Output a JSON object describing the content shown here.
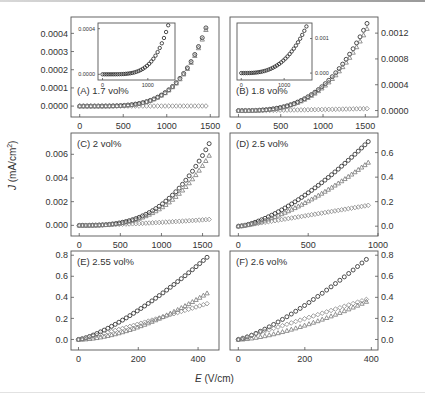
{
  "figure": {
    "ylabel_var": "J",
    "ylabel_unit": " (mA/cm",
    "ylabel_exp": "2",
    "ylabel_close": ")",
    "xlabel_var": "E",
    "xlabel_unit": " (V/cm)"
  },
  "chart_data": [
    {
      "type": "scatter",
      "panel": "A",
      "title": "(A) 1.7 vol%",
      "box": [
        71,
        17,
        219,
        117
      ],
      "yaxis_side": "left",
      "xlim": [
        -100,
        1600
      ],
      "ylim": [
        -6e-05,
        0.00049
      ],
      "xticks": [
        0,
        500,
        1000,
        1500
      ],
      "xtick_labels": [
        "0",
        "500",
        "1000",
        "1500"
      ],
      "yticks": [
        0,
        0.0001,
        0.0002,
        0.0003,
        0.0004
      ],
      "ytick_labels": [
        "0.0000",
        "0.0001",
        "0.0002",
        "0.0003",
        "0.0004"
      ],
      "label_pos": [
        77,
        94
      ],
      "series": [
        {
          "name": "circle",
          "marker": "circle",
          "color": "#222222",
          "x_max": 1450,
          "n": 35,
          "y_end": 0.00043,
          "power": 4.5
        },
        {
          "name": "triangle",
          "marker": "triangle",
          "color": "#777777",
          "x_max": 1450,
          "n": 35,
          "y_end": 0.00042,
          "power": 4.5
        },
        {
          "name": "diamond",
          "marker": "diamond",
          "color": "#888888",
          "x_max": 1450,
          "n": 35,
          "y_end": 5e-07,
          "power": 1
        }
      ],
      "inset": {
        "box": [
          98,
          23,
          175,
          80
        ],
        "xlim": [
          -100,
          1600
        ],
        "ylim": [
          -5e-05,
          0.00045
        ],
        "xticks": [
          0,
          1000
        ],
        "xtick_labels": [
          "0",
          "1000"
        ],
        "yticks": [
          0,
          0.0004
        ],
        "ytick_labels": [
          "0.0000",
          "0.0004"
        ],
        "yaxis_side": "left",
        "series": [
          {
            "marker": "circle",
            "color": "#222222",
            "x_max": 1450,
            "n": 32,
            "y_end": 0.00043,
            "power": 4.5
          }
        ]
      }
    },
    {
      "type": "scatter",
      "panel": "B",
      "title": "(B) 1.8 vol%",
      "box": [
        230,
        17,
        378,
        117
      ],
      "yaxis_side": "right",
      "xlim": [
        -100,
        1650
      ],
      "ylim": [
        -0.0001,
        0.00145
      ],
      "xticks": [
        0,
        500,
        1000,
        1500
      ],
      "xtick_labels": [
        "0",
        "500",
        "1000",
        "1500"
      ],
      "yticks": [
        0,
        0.0004,
        0.0008,
        0.0012
      ],
      "ytick_labels": [
        "0.0000",
        "0.0004",
        "0.0008",
        "0.0012"
      ],
      "label_pos": [
        236,
        94
      ],
      "series": [
        {
          "name": "circle",
          "marker": "circle",
          "color": "#222222",
          "x_max": 1520,
          "n": 38,
          "y_end": 0.00135,
          "power": 3.0
        },
        {
          "name": "triangle",
          "marker": "triangle",
          "color": "#777777",
          "x_max": 1520,
          "n": 38,
          "y_end": 0.00127,
          "power": 3.0
        },
        {
          "name": "diamond",
          "marker": "diamond",
          "color": "#888888",
          "x_max": 1520,
          "n": 38,
          "y_end": 3e-05,
          "power": 1.5
        }
      ],
      "inset": {
        "box": [
          237,
          23,
          312,
          80
        ],
        "xlim": [
          -100,
          1650
        ],
        "ylim": [
          -0.0002,
          0.00145
        ],
        "xticks": [
          0,
          1000
        ],
        "xtick_labels": [
          "0",
          "1000"
        ],
        "yticks": [
          0,
          0.001
        ],
        "ytick_labels": [
          "0.000",
          "0.001"
        ],
        "yaxis_side": "right",
        "series": [
          {
            "marker": "circle",
            "color": "#222222",
            "x_max": 1520,
            "n": 32,
            "y_end": 0.00135,
            "power": 3.0
          }
        ]
      }
    },
    {
      "type": "scatter",
      "panel": "C",
      "title": "(C) 2 vol%",
      "box": [
        71,
        133,
        219,
        236
      ],
      "yaxis_side": "left",
      "xlim": [
        -100,
        1700
      ],
      "ylim": [
        -0.0009,
        0.0078
      ],
      "xticks": [
        0,
        500,
        1000,
        1500
      ],
      "xtick_labels": [
        "0",
        "500",
        "1000",
        "1500"
      ],
      "yticks": [
        0,
        0.002,
        0.004,
        0.006
      ],
      "ytick_labels": [
        "0.000",
        "0.002",
        "0.004",
        "0.006"
      ],
      "label_pos": [
        77,
        147
      ],
      "series": [
        {
          "name": "circle",
          "marker": "circle",
          "color": "#222222",
          "x_max": 1580,
          "n": 40,
          "y_end": 0.0069,
          "power": 3.0
        },
        {
          "name": "triangle",
          "marker": "triangle",
          "color": "#777777",
          "x_max": 1580,
          "n": 40,
          "y_end": 0.0059,
          "power": 3.0
        },
        {
          "name": "diamond",
          "marker": "diamond",
          "color": "#888888",
          "x_max": 1580,
          "n": 40,
          "y_end": 0.0005,
          "power": 1.5
        }
      ]
    },
    {
      "type": "scatter",
      "panel": "D",
      "title": "(D) 2.5 vol%",
      "box": [
        230,
        133,
        378,
        236
      ],
      "yaxis_side": "right",
      "xlim": [
        -60,
        1000
      ],
      "ylim": [
        -0.08,
        0.76
      ],
      "xticks": [
        0,
        500,
        1000
      ],
      "xtick_labels": [
        "0",
        "500",
        "1000"
      ],
      "yticks": [
        0,
        0.2,
        0.4,
        0.6
      ],
      "ytick_labels": [
        "0.0",
        "0.2",
        "0.4",
        "0.6"
      ],
      "label_pos": [
        236,
        147
      ],
      "series": [
        {
          "name": "circle",
          "marker": "circle",
          "color": "#222222",
          "x_max": 930,
          "n": 40,
          "y_end": 0.69,
          "power": 1.5
        },
        {
          "name": "triangle",
          "marker": "triangle",
          "color": "#777777",
          "x_max": 930,
          "n": 40,
          "y_end": 0.52,
          "power": 1.5
        },
        {
          "name": "diamond",
          "marker": "diamond",
          "color": "#888888",
          "x_max": 930,
          "n": 40,
          "y_end": 0.17,
          "power": 1.05
        }
      ]
    },
    {
      "type": "scatter",
      "panel": "E",
      "title": "(E) 2.55 vol%",
      "box": [
        71,
        251,
        219,
        350
      ],
      "yaxis_side": "left",
      "xlim": [
        -25,
        470
      ],
      "ylim": [
        -0.1,
        0.84
      ],
      "xticks": [
        0,
        200,
        400
      ],
      "xtick_labels": [
        "0",
        "200",
        "400"
      ],
      "yticks": [
        0,
        0.2,
        0.4,
        0.6,
        0.8
      ],
      "ytick_labels": [
        "0.0",
        "0.2",
        "0.4",
        "0.6",
        "0.8"
      ],
      "label_pos": [
        77,
        265
      ],
      "series": [
        {
          "name": "circle",
          "marker": "circle",
          "color": "#222222",
          "x_max": 430,
          "n": 36,
          "y_end": 0.78,
          "power": 1.35
        },
        {
          "name": "triangle",
          "marker": "triangle",
          "color": "#777777",
          "x_max": 430,
          "n": 36,
          "y_end": 0.44,
          "power": 1.7
        },
        {
          "name": "diamond",
          "marker": "diamond",
          "color": "#888888",
          "x_max": 430,
          "n": 36,
          "y_end": 0.34,
          "power": 1.1
        }
      ]
    },
    {
      "type": "scatter",
      "panel": "F",
      "title": "(F) 2.6 vol%",
      "box": [
        230,
        251,
        378,
        350
      ],
      "yaxis_side": "right",
      "xlim": [
        -25,
        420
      ],
      "ylim": [
        -0.1,
        0.84
      ],
      "xticks": [
        0,
        200,
        400
      ],
      "xtick_labels": [
        "0",
        "200",
        "400"
      ],
      "yticks": [
        0,
        0.2,
        0.4,
        0.6,
        0.8
      ],
      "ytick_labels": [
        "0.0",
        "0.2",
        "0.4",
        "0.6",
        "0.8"
      ],
      "label_pos": [
        236,
        265
      ],
      "series": [
        {
          "name": "circle",
          "marker": "circle",
          "color": "#222222",
          "x_max": 385,
          "n": 30,
          "y_end": 0.76,
          "power": 1.3
        },
        {
          "name": "diamond",
          "marker": "diamond",
          "color": "#888888",
          "x_max": 385,
          "n": 30,
          "y_end": 0.38,
          "power": 1.0
        },
        {
          "name": "triangle",
          "marker": "triangle",
          "color": "#777777",
          "x_max": 385,
          "n": 30,
          "y_end": 0.36,
          "power": 1.5
        }
      ]
    }
  ]
}
